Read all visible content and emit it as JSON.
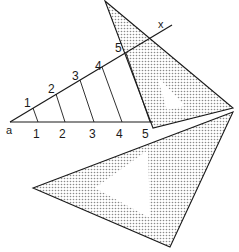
{
  "diagram": {
    "point_a_label": "a",
    "point_x_label": "x",
    "inclined_line_labels": [
      "1",
      "2",
      "3",
      "4",
      "5"
    ],
    "base_line_labels": [
      "1",
      "2",
      "3",
      "4",
      "5"
    ],
    "shading_color": "#9a9a9a",
    "line_color": "#1a1a1a",
    "components": [
      "upper-set-square",
      "lower-set-square",
      "base-line",
      "inclined-line",
      "parallel-division-lines"
    ]
  }
}
